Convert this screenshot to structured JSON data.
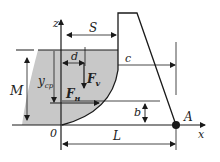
{
  "diagram": {
    "labels": {
      "z": "z",
      "x": "x",
      "S": "S",
      "d": "d",
      "c": "c",
      "M": "M",
      "y_cp": "y",
      "y_cp_sub": "cp",
      "F_v": "F",
      "F_v_sub": "v",
      "F_H": "F",
      "F_H_sub": "н",
      "b": "b",
      "origin": "0",
      "L": "L",
      "A": "A"
    },
    "colors": {
      "water": "#c8c8c8",
      "line": "#1a1a1a"
    }
  }
}
